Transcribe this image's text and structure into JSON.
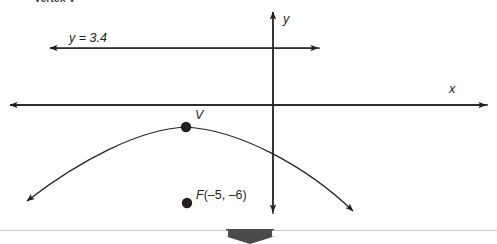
{
  "page": {
    "background_color": "#ffffff",
    "ink_color": "#231f20",
    "width": 497,
    "height": 244
  },
  "header": {
    "text": "Vertex V"
  },
  "figure": {
    "type": "parabola-diagram",
    "axes": {
      "x_label": "x",
      "y_label": "y",
      "x_axis_y": 105,
      "y_axis_x": 273,
      "x_axis_from": 8,
      "x_axis_to": 488,
      "y_axis_from": 10,
      "y_axis_to": 215
    },
    "directrix": {
      "label": "y = 3.4",
      "label_var": "y",
      "label_rest": " = 3.4",
      "line_y": 48,
      "line_from": 48,
      "line_to": 320
    },
    "vertex": {
      "label": "V",
      "x": 186,
      "y": 127
    },
    "focus": {
      "label_var": "F",
      "label_coords": "(–5, –6)",
      "x": 187,
      "y": 203
    },
    "curve": {
      "opens": "down",
      "left_arrow_tip_x": 22,
      "left_arrow_tip_y": 205,
      "right_arrow_tip_x": 358,
      "right_arrow_tip_y": 215
    }
  },
  "footer": {
    "rule_color": "#c9c9c9",
    "arrow_color": "#4b4b4b",
    "arrow_name": "scroll-down-arrow"
  }
}
